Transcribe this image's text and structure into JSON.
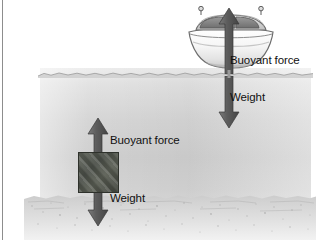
{
  "figure": {
    "background_color": "#ffffff",
    "water_color": "#d4d4d4",
    "arrow_color": "#5a5a5a",
    "block_color": "#4a4e47",
    "label_color": "#111111"
  },
  "labels": {
    "boat_buoyant": "Buoyant force",
    "boat_weight": "Weight",
    "block_buoyant": "Buoyant force",
    "block_weight": "Weight"
  },
  "objects": {
    "boat": {
      "name": "boat",
      "state": "floating",
      "hull_color": "#f2f2f2"
    },
    "block": {
      "name": "block",
      "state": "sunk",
      "color": "#4a4e47"
    },
    "water": {
      "name": "water",
      "surface_label": "water surface"
    },
    "seafloor": {
      "name": "sea floor",
      "color": "#cdcdcd"
    }
  },
  "arrows": {
    "boat_buoyant": {
      "direction": "up",
      "label": "Buoyant force",
      "relative_length": "long"
    },
    "boat_weight": {
      "direction": "down",
      "label": "Weight",
      "relative_length": "long"
    },
    "block_buoyant": {
      "direction": "up",
      "label": "Buoyant force",
      "relative_length": "short"
    },
    "block_weight": {
      "direction": "down",
      "label": "Weight",
      "relative_length": "long"
    }
  }
}
